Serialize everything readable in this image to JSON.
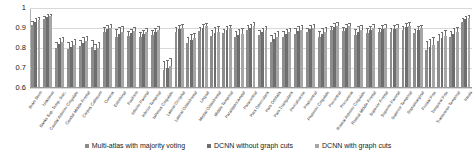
{
  "chart_data": {
    "type": "bar",
    "title": "",
    "subtitle": "",
    "xlabel": "",
    "ylabel": "",
    "ylim": [
      0.6,
      1.0
    ],
    "yticks": [
      "0.6",
      "0.7",
      "0.8",
      "0.9",
      "1"
    ],
    "grid": true,
    "legend_position": "bottom",
    "error_bars": true,
    "categories": [
      "Brain Stem",
      "Unknown",
      "Banks Sup. Temp. Sulc.",
      "Caudal Anterior Cingulate",
      "Caudal Middle Frontal",
      "Corpus Callosum",
      "Cuneus",
      "Entorhinal",
      "Fusiform",
      "Inferior Parietal",
      "Inferior Temporal",
      "Isthmus Cingulate",
      "Lateral Occipital",
      "Lateral Orbitofrontal",
      "Lingual",
      "Medial Orbitofrontal",
      "Middle Temporal",
      "Parahippocampal",
      "Paracentral",
      "Pars Opercularis",
      "Pars Orbitalis",
      "Pars Triangularis",
      "Pericalcarine",
      "Postcentral",
      "Posterior Cingulate",
      "Precentral",
      "Precuneus",
      "Rostral Anterior Cingulate",
      "Rostral Middle Frontal",
      "Superior Frontal",
      "Superior Parietal",
      "Superior Temporal",
      "Supramarginal",
      "Frontal Pole",
      "Temporal Pole",
      "Transverse Temporal",
      "Insula"
    ],
    "series": [
      {
        "name": "Multi-atlas with majority voting",
        "color": "#8c8c8c",
        "values": [
          0.915,
          0.945,
          0.8,
          0.795,
          0.81,
          0.805,
          0.88,
          0.855,
          0.86,
          0.855,
          0.865,
          0.69,
          0.88,
          0.825,
          0.885,
          0.86,
          0.875,
          0.855,
          0.89,
          0.865,
          0.83,
          0.855,
          0.87,
          0.88,
          0.855,
          0.89,
          0.885,
          0.865,
          0.875,
          0.88,
          0.88,
          0.89,
          0.875,
          0.79,
          0.835,
          0.855,
          0.93
        ],
        "errors": [
          0.02,
          0.016,
          0.03,
          0.035,
          0.03,
          0.035,
          0.025,
          0.04,
          0.025,
          0.025,
          0.025,
          0.045,
          0.025,
          0.03,
          0.022,
          0.03,
          0.022,
          0.03,
          0.025,
          0.025,
          0.035,
          0.028,
          0.028,
          0.022,
          0.03,
          0.02,
          0.022,
          0.032,
          0.025,
          0.022,
          0.022,
          0.02,
          0.022,
          0.045,
          0.035,
          0.03,
          0.018
        ]
      },
      {
        "name": "DCNN without graph cuts",
        "color": "#6e6e6e",
        "values": [
          0.93,
          0.955,
          0.82,
          0.805,
          0.825,
          0.79,
          0.895,
          0.87,
          0.875,
          0.87,
          0.88,
          0.7,
          0.895,
          0.84,
          0.9,
          0.875,
          0.89,
          0.865,
          0.9,
          0.88,
          0.845,
          0.87,
          0.885,
          0.895,
          0.87,
          0.905,
          0.9,
          0.88,
          0.89,
          0.895,
          0.895,
          0.905,
          0.89,
          0.805,
          0.85,
          0.87,
          0.945
        ],
        "errors": [
          0.018,
          0.014,
          0.028,
          0.032,
          0.028,
          0.032,
          0.022,
          0.036,
          0.022,
          0.022,
          0.022,
          0.042,
          0.022,
          0.028,
          0.02,
          0.028,
          0.02,
          0.028,
          0.022,
          0.022,
          0.032,
          0.026,
          0.026,
          0.02,
          0.028,
          0.018,
          0.02,
          0.03,
          0.022,
          0.02,
          0.02,
          0.018,
          0.02,
          0.042,
          0.032,
          0.028,
          0.016
        ]
      },
      {
        "name": "DCNN with graph cuts",
        "color": "#a6a6a6",
        "values": [
          0.938,
          0.96,
          0.83,
          0.815,
          0.835,
          0.8,
          0.9,
          0.878,
          0.885,
          0.878,
          0.888,
          0.712,
          0.902,
          0.85,
          0.908,
          0.882,
          0.898,
          0.872,
          0.908,
          0.888,
          0.855,
          0.878,
          0.892,
          0.902,
          0.878,
          0.912,
          0.908,
          0.888,
          0.898,
          0.902,
          0.902,
          0.912,
          0.898,
          0.815,
          0.858,
          0.878,
          0.952
        ],
        "errors": [
          0.016,
          0.012,
          0.026,
          0.03,
          0.026,
          0.03,
          0.02,
          0.034,
          0.02,
          0.02,
          0.02,
          0.04,
          0.02,
          0.026,
          0.018,
          0.026,
          0.018,
          0.026,
          0.02,
          0.02,
          0.03,
          0.024,
          0.024,
          0.018,
          0.026,
          0.016,
          0.018,
          0.028,
          0.02,
          0.018,
          0.018,
          0.016,
          0.018,
          0.04,
          0.03,
          0.026,
          0.014
        ]
      }
    ]
  },
  "legend": {
    "entries": [
      {
        "label": "Multi-atlas with majority voting",
        "color": "#8c8c8c"
      },
      {
        "label": "DCNN without graph cuts",
        "color": "#6e6e6e"
      },
      {
        "label": "DCNN with graph cuts",
        "color": "#a6a6a6"
      }
    ]
  }
}
